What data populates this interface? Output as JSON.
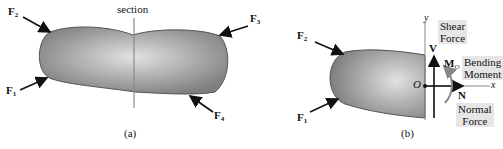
{
  "figure_a": {
    "section_label": "section",
    "caption": "(a)",
    "forces": [
      {
        "symbol": "F",
        "sub": "1"
      },
      {
        "symbol": "F",
        "sub": "2"
      },
      {
        "symbol": "F",
        "sub": "3"
      },
      {
        "symbol": "F",
        "sub": "4"
      }
    ]
  },
  "figure_b": {
    "caption": "(b)",
    "forces": [
      {
        "symbol": "F",
        "sub": "2"
      },
      {
        "symbol": "F",
        "sub": "1"
      }
    ],
    "axes": {
      "x": "x",
      "y": "y",
      "origin": "O"
    },
    "internal": {
      "shear": {
        "symbol": "V",
        "label_line1": "Shear",
        "label_line2": "Force"
      },
      "moment": {
        "symbol": "M",
        "sub": "O",
        "label_line1": "Bending",
        "label_line2": "Moment"
      },
      "normal": {
        "symbol": "N",
        "label_line1": "Normal",
        "label_line2": "Force"
      }
    }
  },
  "colors": {
    "body_dark": "#7a7a7a",
    "body_light": "#d8d8d8",
    "section_line": "#8a8a8a",
    "label_box": "#e6e6e6"
  }
}
